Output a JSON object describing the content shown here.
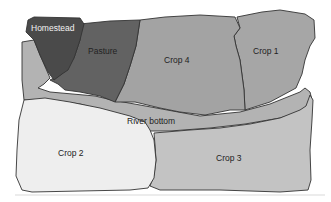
{
  "diagram": {
    "type": "farm-field-map",
    "colors": {
      "background": "#ffffff",
      "homestead": "#4a4a4a",
      "pasture": "#626262",
      "crop4": "#a3a3a3",
      "crop1": "#a6a6a6",
      "river_bottom": "#b3b3b3",
      "crop2": "#eeeeee",
      "crop3": "#c3c3c3",
      "outline": "#333333"
    },
    "regions": [
      {
        "id": "homestead",
        "label": "Homestead"
      },
      {
        "id": "pasture",
        "label": "Pasture"
      },
      {
        "id": "crop4",
        "label": "Crop 4"
      },
      {
        "id": "crop1",
        "label": "Crop 1"
      },
      {
        "id": "river_bottom",
        "label": "River bottom"
      },
      {
        "id": "crop2",
        "label": "Crop 2"
      },
      {
        "id": "crop3",
        "label": "Crop 3"
      }
    ]
  }
}
